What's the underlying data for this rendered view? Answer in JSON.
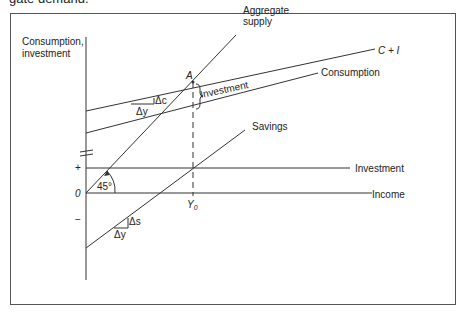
{
  "caption_fragment": "gate demand.",
  "diagram": {
    "y_axis_label_line1": "Consumption,",
    "y_axis_label_line2": "investment",
    "x_axis_label": "Income",
    "origin_label": "0",
    "plus_label": "+",
    "minus_label": "−",
    "equilibrium_point": "A",
    "equilibrium_income": "Y",
    "equilibrium_income_sub": "0",
    "angle_label": "45°",
    "lines": {
      "aggregate_supply_1": "Aggregate",
      "aggregate_supply_2": "supply",
      "c_plus_i": "C + I",
      "consumption": "Consumption",
      "savings": "Savings",
      "investment": "Investment"
    },
    "gap_label": "Investment",
    "slope_c_delta_c": "Δc",
    "slope_c_delta_y": "Δy",
    "slope_s_delta_s": "Δs",
    "slope_s_delta_y": "Δy"
  }
}
